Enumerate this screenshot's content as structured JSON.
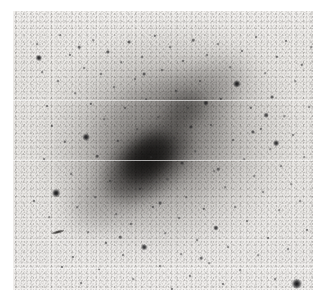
{
  "figure": {
    "kind": "astronomical-plate-image",
    "caption": "",
    "width_px": 329,
    "height_px": 295
  },
  "plate": {
    "left": 13,
    "top": 11,
    "width": 300,
    "height": 279,
    "background_color": "#edebe8",
    "page_color": "#ffffff",
    "grain_color": "#5a5856"
  },
  "galaxy": {
    "name": "",
    "center_x_pct": 47,
    "center_y_pct": 50,
    "bar_angle_deg": -38,
    "core_color": "#181716",
    "halo_color": "#8e8b88",
    "components": [
      {
        "id": "outer-halo",
        "cx": 50,
        "cy": 46,
        "rx": 40,
        "ry": 36,
        "rot": -35,
        "opacity": 0.3,
        "blur": 16,
        "color": "#8a8784"
      },
      {
        "id": "disk",
        "cx": 48,
        "cy": 48,
        "rx": 30,
        "ry": 26,
        "rot": -38,
        "opacity": 0.38,
        "blur": 12,
        "color": "#6f6c6a"
      },
      {
        "id": "spiral-arm-ne",
        "cx": 62,
        "cy": 30,
        "rx": 18,
        "ry": 10,
        "rot": -30,
        "opacity": 0.4,
        "blur": 10,
        "color": "#5e5b59"
      },
      {
        "id": "spiral-arm-sw",
        "cx": 33,
        "cy": 66,
        "rx": 17,
        "ry": 10,
        "rot": -30,
        "opacity": 0.34,
        "blur": 10,
        "color": "#666361"
      },
      {
        "id": "inner-ring",
        "cx": 49,
        "cy": 45,
        "rx": 22,
        "ry": 19,
        "rot": -38,
        "opacity": 0.34,
        "blur": 9,
        "color": "#4e4b49"
      },
      {
        "id": "bar",
        "cx": 45,
        "cy": 54,
        "rx": 17,
        "ry": 11,
        "rot": -38,
        "opacity": 0.78,
        "blur": 7,
        "color": "#232120"
      },
      {
        "id": "nucleus",
        "cx": 45,
        "cy": 53,
        "rx": 10,
        "ry": 7,
        "rot": -38,
        "opacity": 0.92,
        "blur": 5,
        "color": "#151413"
      },
      {
        "id": "secondary-knot",
        "cx": 57,
        "cy": 36,
        "rx": 8,
        "ry": 6,
        "rot": -38,
        "opacity": 0.52,
        "blur": 6,
        "color": "#3a3836"
      }
    ]
  },
  "artifacts": {
    "scanlines_y": [
      100,
      160,
      268
    ],
    "streaks": [
      {
        "id": "edge-on-galaxy",
        "x": 45,
        "y": 221,
        "w": 13,
        "h": 3
      }
    ]
  },
  "stars": [
    {
      "x": 21,
      "y": 190,
      "r": 1.2,
      "i": 0.7
    },
    {
      "x": 24,
      "y": 33,
      "r": 1.0,
      "i": 0.6
    },
    {
      "x": 26,
      "y": 47,
      "r": 2.4,
      "i": 0.95
    },
    {
      "x": 29,
      "y": 61,
      "r": 1.0,
      "i": 0.6
    },
    {
      "x": 31,
      "y": 148,
      "r": 1.1,
      "i": 0.62
    },
    {
      "x": 34,
      "y": 95,
      "r": 1.1,
      "i": 0.65
    },
    {
      "x": 36,
      "y": 206,
      "r": 1.0,
      "i": 0.58
    },
    {
      "x": 39,
      "y": 115,
      "r": 1.3,
      "i": 0.7
    },
    {
      "x": 43,
      "y": 182,
      "r": 3.0,
      "i": 1.0
    },
    {
      "x": 45,
      "y": 70,
      "r": 1.1,
      "i": 0.62
    },
    {
      "x": 47,
      "y": 24,
      "r": 1.0,
      "i": 0.58
    },
    {
      "x": 49,
      "y": 256,
      "r": 1.2,
      "i": 0.66
    },
    {
      "x": 52,
      "y": 131,
      "r": 1.3,
      "i": 0.7
    },
    {
      "x": 55,
      "y": 285,
      "r": 1.6,
      "i": 0.8
    },
    {
      "x": 57,
      "y": 44,
      "r": 1.2,
      "i": 0.66
    },
    {
      "x": 58,
      "y": 163,
      "r": 1.1,
      "i": 0.6
    },
    {
      "x": 60,
      "y": 246,
      "r": 1.2,
      "i": 0.66
    },
    {
      "x": 62,
      "y": 82,
      "r": 1.0,
      "i": 0.56
    },
    {
      "x": 64,
      "y": 196,
      "r": 1.0,
      "i": 0.58
    },
    {
      "x": 66,
      "y": 36,
      "r": 1.4,
      "i": 0.74
    },
    {
      "x": 68,
      "y": 272,
      "r": 1.1,
      "i": 0.62
    },
    {
      "x": 71,
      "y": 57,
      "r": 1.1,
      "i": 0.6
    },
    {
      "x": 73,
      "y": 126,
      "r": 2.6,
      "i": 0.96
    },
    {
      "x": 75,
      "y": 221,
      "r": 1.0,
      "i": 0.56
    },
    {
      "x": 78,
      "y": 93,
      "r": 1.3,
      "i": 0.7
    },
    {
      "x": 80,
      "y": 29,
      "r": 1.0,
      "i": 0.56
    },
    {
      "x": 82,
      "y": 186,
      "r": 1.0,
      "i": 0.58
    },
    {
      "x": 84,
      "y": 145,
      "r": 1.4,
      "i": 0.74
    },
    {
      "x": 86,
      "y": 258,
      "r": 1.1,
      "i": 0.62
    },
    {
      "x": 88,
      "y": 63,
      "r": 1.2,
      "i": 0.66
    },
    {
      "x": 91,
      "y": 108,
      "r": 1.0,
      "i": 0.58
    },
    {
      "x": 93,
      "y": 232,
      "r": 1.2,
      "i": 0.68
    },
    {
      "x": 95,
      "y": 41,
      "r": 1.6,
      "i": 0.8
    },
    {
      "x": 97,
      "y": 170,
      "r": 1.2,
      "i": 0.66
    },
    {
      "x": 99,
      "y": 282,
      "r": 1.4,
      "i": 0.74
    },
    {
      "x": 101,
      "y": 76,
      "r": 1.1,
      "i": 0.6
    },
    {
      "x": 103,
      "y": 203,
      "r": 1.0,
      "i": 0.56
    },
    {
      "x": 105,
      "y": 130,
      "r": 1.3,
      "i": 0.7
    },
    {
      "x": 108,
      "y": 51,
      "r": 1.0,
      "i": 0.56
    },
    {
      "x": 110,
      "y": 244,
      "r": 1.1,
      "i": 0.62
    },
    {
      "x": 112,
      "y": 97,
      "r": 1.2,
      "i": 0.66
    },
    {
      "x": 114,
      "y": 159,
      "r": 1.0,
      "i": 0.58
    },
    {
      "x": 116,
      "y": 31,
      "r": 1.5,
      "i": 0.78
    },
    {
      "x": 118,
      "y": 213,
      "r": 1.2,
      "i": 0.68
    },
    {
      "x": 120,
      "y": 268,
      "r": 1.0,
      "i": 0.56
    },
    {
      "x": 122,
      "y": 68,
      "r": 1.1,
      "i": 0.6
    },
    {
      "x": 124,
      "y": 118,
      "r": 1.0,
      "i": 0.56
    },
    {
      "x": 127,
      "y": 178,
      "r": 1.3,
      "i": 0.72
    },
    {
      "x": 129,
      "y": 46,
      "r": 1.1,
      "i": 0.62
    },
    {
      "x": 131,
      "y": 236,
      "r": 2.2,
      "i": 0.92
    },
    {
      "x": 133,
      "y": 88,
      "r": 1.0,
      "i": 0.58
    },
    {
      "x": 136,
      "y": 288,
      "r": 1.1,
      "i": 0.6
    },
    {
      "x": 138,
      "y": 146,
      "r": 1.0,
      "i": 0.54
    },
    {
      "x": 140,
      "y": 196,
      "r": 1.2,
      "i": 0.66
    },
    {
      "x": 142,
      "y": 25,
      "r": 1.3,
      "i": 0.7
    },
    {
      "x": 145,
      "y": 106,
      "r": 1.0,
      "i": 0.54
    },
    {
      "x": 147,
      "y": 255,
      "r": 1.1,
      "i": 0.62
    },
    {
      "x": 149,
      "y": 59,
      "r": 1.2,
      "i": 0.66
    },
    {
      "x": 152,
      "y": 222,
      "r": 1.0,
      "i": 0.56
    },
    {
      "x": 154,
      "y": 168,
      "r": 1.0,
      "i": 0.54
    },
    {
      "x": 157,
      "y": 36,
      "r": 1.1,
      "i": 0.62
    },
    {
      "x": 159,
      "y": 278,
      "r": 1.2,
      "i": 0.66
    },
    {
      "x": 161,
      "y": 127,
      "r": 1.0,
      "i": 0.52
    },
    {
      "x": 163,
      "y": 80,
      "r": 1.3,
      "i": 0.7
    },
    {
      "x": 166,
      "y": 207,
      "r": 1.1,
      "i": 0.6
    },
    {
      "x": 168,
      "y": 243,
      "r": 1.0,
      "i": 0.56
    },
    {
      "x": 170,
      "y": 50,
      "r": 1.2,
      "i": 0.66
    },
    {
      "x": 173,
      "y": 186,
      "r": 1.0,
      "i": 0.52
    },
    {
      "x": 175,
      "y": 97,
      "r": 1.1,
      "i": 0.58
    },
    {
      "x": 177,
      "y": 265,
      "r": 1.2,
      "i": 0.66
    },
    {
      "x": 180,
      "y": 29,
      "r": 1.4,
      "i": 0.74
    },
    {
      "x": 182,
      "y": 140,
      "r": 1.0,
      "i": 0.52
    },
    {
      "x": 184,
      "y": 229,
      "r": 1.1,
      "i": 0.6
    },
    {
      "x": 187,
      "y": 70,
      "r": 1.2,
      "i": 0.64
    },
    {
      "x": 189,
      "y": 287,
      "r": 1.0,
      "i": 0.56
    },
    {
      "x": 191,
      "y": 198,
      "r": 1.3,
      "i": 0.7
    },
    {
      "x": 194,
      "y": 44,
      "r": 1.1,
      "i": 0.6
    },
    {
      "x": 196,
      "y": 252,
      "r": 1.0,
      "i": 0.56
    },
    {
      "x": 198,
      "y": 114,
      "r": 1.2,
      "i": 0.64
    },
    {
      "x": 201,
      "y": 160,
      "r": 1.0,
      "i": 0.52
    },
    {
      "x": 203,
      "y": 217,
      "r": 2.0,
      "i": 0.88
    },
    {
      "x": 205,
      "y": 33,
      "r": 1.1,
      "i": 0.6
    },
    {
      "x": 208,
      "y": 88,
      "r": 1.3,
      "i": 0.7
    },
    {
      "x": 210,
      "y": 273,
      "r": 1.2,
      "i": 0.66
    },
    {
      "x": 212,
      "y": 176,
      "r": 1.0,
      "i": 0.54
    },
    {
      "x": 215,
      "y": 236,
      "r": 1.1,
      "i": 0.6
    },
    {
      "x": 217,
      "y": 56,
      "r": 1.0,
      "i": 0.56
    },
    {
      "x": 220,
      "y": 129,
      "r": 1.2,
      "i": 0.64
    },
    {
      "x": 222,
      "y": 196,
      "r": 1.1,
      "i": 0.58
    },
    {
      "x": 224,
      "y": 73,
      "r": 2.8,
      "i": 0.98
    },
    {
      "x": 227,
      "y": 259,
      "r": 1.0,
      "i": 0.54
    },
    {
      "x": 229,
      "y": 40,
      "r": 1.2,
      "i": 0.64
    },
    {
      "x": 231,
      "y": 148,
      "r": 1.0,
      "i": 0.52
    },
    {
      "x": 234,
      "y": 210,
      "r": 1.1,
      "i": 0.6
    },
    {
      "x": 236,
      "y": 284,
      "r": 1.2,
      "i": 0.66
    },
    {
      "x": 238,
      "y": 97,
      "r": 1.3,
      "i": 0.7
    },
    {
      "x": 241,
      "y": 165,
      "r": 1.0,
      "i": 0.54
    },
    {
      "x": 243,
      "y": 26,
      "r": 1.1,
      "i": 0.6
    },
    {
      "x": 245,
      "y": 244,
      "r": 1.0,
      "i": 0.56
    },
    {
      "x": 248,
      "y": 118,
      "r": 1.2,
      "i": 0.64
    },
    {
      "x": 250,
      "y": 181,
      "r": 1.1,
      "i": 0.58
    },
    {
      "x": 252,
      "y": 62,
      "r": 1.0,
      "i": 0.54
    },
    {
      "x": 255,
      "y": 227,
      "r": 1.2,
      "i": 0.64
    },
    {
      "x": 257,
      "y": 138,
      "r": 1.0,
      "i": 0.52
    },
    {
      "x": 259,
      "y": 86,
      "r": 1.5,
      "i": 0.78
    },
    {
      "x": 262,
      "y": 268,
      "r": 1.1,
      "i": 0.6
    },
    {
      "x": 264,
      "y": 46,
      "r": 1.3,
      "i": 0.7
    },
    {
      "x": 266,
      "y": 199,
      "r": 1.0,
      "i": 0.54
    },
    {
      "x": 268,
      "y": 155,
      "r": 1.1,
      "i": 0.58
    },
    {
      "x": 271,
      "y": 105,
      "r": 1.0,
      "i": 0.54
    },
    {
      "x": 273,
      "y": 30,
      "r": 1.2,
      "i": 0.64
    },
    {
      "x": 275,
      "y": 238,
      "r": 1.1,
      "i": 0.58
    },
    {
      "x": 278,
      "y": 173,
      "r": 1.0,
      "i": 0.52
    },
    {
      "x": 280,
      "y": 124,
      "r": 1.2,
      "i": 0.64
    },
    {
      "x": 282,
      "y": 70,
      "r": 1.0,
      "i": 0.54
    },
    {
      "x": 284,
      "y": 273,
      "r": 4.0,
      "i": 1.0
    },
    {
      "x": 287,
      "y": 190,
      "r": 1.1,
      "i": 0.58
    },
    {
      "x": 289,
      "y": 54,
      "r": 1.3,
      "i": 0.7
    },
    {
      "x": 291,
      "y": 146,
      "r": 1.0,
      "i": 0.52
    },
    {
      "x": 294,
      "y": 219,
      "r": 1.2,
      "i": 0.64
    },
    {
      "x": 296,
      "y": 96,
      "r": 1.1,
      "i": 0.58
    },
    {
      "x": 298,
      "y": 36,
      "r": 1.0,
      "i": 0.54
    },
    {
      "x": 301,
      "y": 250,
      "r": 1.2,
      "i": 0.64
    },
    {
      "x": 303,
      "y": 165,
      "r": 1.0,
      "i": 0.52
    },
    {
      "x": 305,
      "y": 112,
      "r": 1.1,
      "i": 0.58
    },
    {
      "x": 307,
      "y": 205,
      "r": 1.0,
      "i": 0.54
    },
    {
      "x": 309,
      "y": 64,
      "r": 1.2,
      "i": 0.64
    },
    {
      "x": 296,
      "y": 284,
      "r": 1.8,
      "i": 0.86
    },
    {
      "x": 263,
      "y": 132,
      "r": 2.2,
      "i": 0.92
    },
    {
      "x": 253,
      "y": 104,
      "r": 1.8,
      "i": 0.84
    },
    {
      "x": 240,
      "y": 121,
      "r": 1.6,
      "i": 0.8
    },
    {
      "x": 193,
      "y": 92,
      "r": 2.0,
      "i": 0.88
    },
    {
      "x": 178,
      "y": 116,
      "r": 1.6,
      "i": 0.78
    },
    {
      "x": 169,
      "y": 152,
      "r": 1.5,
      "i": 0.76
    },
    {
      "x": 147,
      "y": 192,
      "r": 1.5,
      "i": 0.76
    },
    {
      "x": 205,
      "y": 158,
      "r": 1.4,
      "i": 0.72
    },
    {
      "x": 131,
      "y": 63,
      "r": 1.5,
      "i": 0.76
    },
    {
      "x": 107,
      "y": 226,
      "r": 1.4,
      "i": 0.72
    },
    {
      "x": 188,
      "y": 247,
      "r": 1.4,
      "i": 0.72
    }
  ]
}
